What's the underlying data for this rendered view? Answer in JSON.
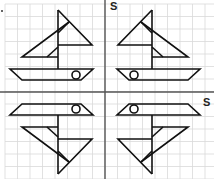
{
  "figure": {
    "colors": {
      "grid": "#d9d9d9",
      "axis": "#555555",
      "shape": "#111111",
      "background": "#ffffff"
    },
    "grid": {
      "spacing": 12.5,
      "origin_x": 5,
      "origin_y": 4
    },
    "vertical_axis": {
      "x": 105,
      "label": "S",
      "label_x": 110,
      "label_y": 1
    },
    "horizontal_axis": {
      "y": 92,
      "label": "S",
      "label_x": 203,
      "label_y": 97
    },
    "boats": [
      {
        "name": "top-left",
        "flip_x": false,
        "flip_y": false
      },
      {
        "name": "top-right",
        "flip_x": true,
        "flip_y": false
      },
      {
        "name": "bottom-left",
        "flip_x": false,
        "flip_y": true
      },
      {
        "name": "bottom-right",
        "flip_x": true,
        "flip_y": true
      }
    ]
  }
}
